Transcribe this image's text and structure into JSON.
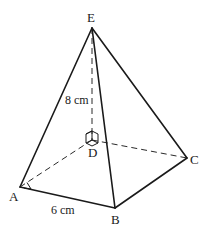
{
  "figure": {
    "type": "square-based pyramid",
    "vertices": {
      "A": {
        "label": "A",
        "x": 20,
        "y": 187
      },
      "B": {
        "label": "B",
        "x": 115,
        "y": 208
      },
      "C": {
        "label": "C",
        "x": 187,
        "y": 158
      },
      "D": {
        "label": "D",
        "x": 92,
        "y": 140
      },
      "E": {
        "label": "E",
        "x": 92,
        "y": 28
      }
    },
    "measurements": {
      "height": "8 cm",
      "base_edge": "6 cm"
    },
    "right_angles": [
      "at A (DAB)",
      "at D (ED ⟂ base)"
    ],
    "hidden_edges": [
      "AD",
      "DC",
      "ED"
    ],
    "visible_edges": [
      "AB",
      "BC",
      "EA",
      "EB",
      "EC"
    ],
    "stroke_color": "#1a1a1a",
    "background": "#ffffff"
  }
}
